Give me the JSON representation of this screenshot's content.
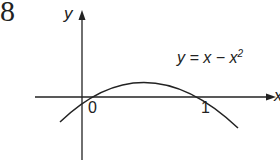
{
  "question_number": "8",
  "axes": {
    "x_label": "x",
    "y_label": "y"
  },
  "ticks": {
    "origin": "0",
    "one": "1"
  },
  "curve_label": "y = x − x",
  "curve_label_exp": "2",
  "colors": {
    "ink": "#222222",
    "background": "#ffffff"
  }
}
